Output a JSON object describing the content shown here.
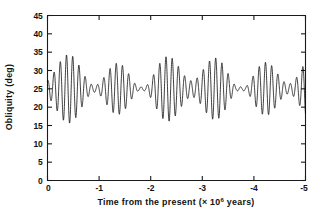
{
  "chart_data": {
    "type": "line",
    "title": "",
    "xlabel": "Time from the present (× 10⁶ years)",
    "xlabel_main": "Time from the present (× 10",
    "xlabel_exponent": "6",
    "xlabel_tail": " years)",
    "ylabel": "Obliquity (deg)",
    "xlim": [
      0,
      -5
    ],
    "ylim": [
      0,
      45
    ],
    "xticks": [
      0,
      -1,
      -2,
      -3,
      -4,
      -5
    ],
    "xticklabels": [
      "0",
      "-1",
      "-2",
      "-3",
      "-4",
      "-5"
    ],
    "yticks": [
      0,
      5,
      10,
      15,
      20,
      25,
      30,
      35,
      40,
      45
    ],
    "yticklabels": [
      "0",
      "5",
      "10",
      "15",
      "20",
      "25",
      "30",
      "35",
      "40",
      "45"
    ],
    "grid": false,
    "legend": null,
    "units": {
      "x": "million years",
      "y": "degrees"
    },
    "series": [
      {
        "name": "Obliquity",
        "color": "#000000",
        "description": "Quasi-periodic obliquity oscillation, mean about 25 deg, dominant period about 0.12 x 10^6 yr, amplitude modulated by a long-period envelope with nodes near -1.6, -2.45 and -3.55 x 10^6 yr and antinodes (maxima) near -1.15, -2.05, -3.0 and -4.05 x 10^6 yr",
        "mean": 25.0,
        "carrier_period_Myr": 0.1205,
        "carrier_phase_deg": 20,
        "envelope_mean_amplitude": 4.6,
        "envelope_modulation_amplitude": 3.6,
        "envelope_period_Myr": 0.95,
        "envelope_phase_deg": 158,
        "secondary_envelope_amplitude": 1.25,
        "secondary_envelope_period_Myr": 2.45,
        "secondary_envelope_phase_deg": 40,
        "approx_max": 35.0,
        "approx_min": 15.8,
        "value_at_t0": 24.6,
        "sample_points": [
          {
            "t": 0.0,
            "y": 24.6
          },
          {
            "t": -0.06,
            "y": 22.4
          },
          {
            "t": -0.12,
            "y": 26.2
          },
          {
            "t": -0.3,
            "y": 22.0
          },
          {
            "t": -0.5,
            "y": 30.8
          },
          {
            "t": -0.72,
            "y": 17.4
          },
          {
            "t": -0.9,
            "y": 33.0
          },
          {
            "t": -1.15,
            "y": 34.0
          },
          {
            "t": -1.3,
            "y": 17.2
          },
          {
            "t": -1.6,
            "y": 25.6
          },
          {
            "t": -1.85,
            "y": 31.6
          },
          {
            "t": -2.05,
            "y": 33.4
          },
          {
            "t": -2.2,
            "y": 16.2
          },
          {
            "t": -2.45,
            "y": 25.2
          },
          {
            "t": -2.75,
            "y": 30.6
          },
          {
            "t": -3.0,
            "y": 33.2
          },
          {
            "t": -3.15,
            "y": 16.0
          },
          {
            "t": -3.55,
            "y": 25.4
          },
          {
            "t": -3.8,
            "y": 32.0
          },
          {
            "t": -4.05,
            "y": 35.0
          },
          {
            "t": -4.2,
            "y": 15.8
          },
          {
            "t": -4.6,
            "y": 24.8
          },
          {
            "t": -4.85,
            "y": 28.0
          },
          {
            "t": -5.0,
            "y": 25.4
          }
        ]
      }
    ]
  },
  "accent_colors": {
    "line": "#000000",
    "axis": "#1a1a1a",
    "text": "#111111",
    "background": "#ffffff"
  }
}
